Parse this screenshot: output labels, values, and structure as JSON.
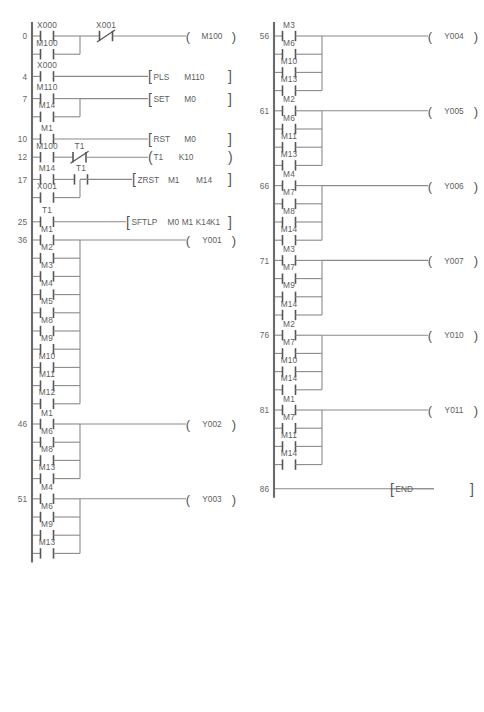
{
  "document": {
    "type": "plc-ladder-logic-diagram",
    "title": "",
    "background_color": "#ffffff",
    "line_color": "#6a6a6a",
    "text_color": "#5d5d5d"
  },
  "columns": [
    {
      "id": "left-column",
      "rungs": [
        {
          "step": "0",
          "branches": [
            [
              {
                "type": "no",
                "label": "X000"
              }
            ],
            [
              {
                "type": "no",
                "label": "M100"
              }
            ]
          ],
          "series_after_branch": [
            {
              "type": "nc",
              "label": "X001"
            }
          ],
          "output": {
            "type": "coil",
            "label": "M100"
          }
        },
        {
          "step": "4",
          "branches": [
            [
              {
                "type": "no",
                "label": "X000"
              }
            ]
          ],
          "output": {
            "type": "instruction",
            "name": "PLS",
            "operands": [
              "M110"
            ],
            "bracket": "square"
          }
        },
        {
          "step": "7",
          "branches": [
            [
              {
                "type": "no",
                "label": "M110"
              }
            ],
            [
              {
                "type": "no",
                "label": "M14"
              }
            ]
          ],
          "output": {
            "type": "instruction",
            "name": "SET",
            "operands": [
              "M0"
            ],
            "bracket": "square"
          }
        },
        {
          "step": "10",
          "branches": [
            [
              {
                "type": "no",
                "label": "M1"
              }
            ]
          ],
          "output": {
            "type": "instruction",
            "name": "RST",
            "operands": [
              "M0"
            ],
            "bracket": "square"
          }
        },
        {
          "step": "12",
          "branches": [
            [
              {
                "type": "no",
                "label": "M100"
              }
            ]
          ],
          "series_after_branch": [
            {
              "type": "nc",
              "label": "T1"
            }
          ],
          "output": {
            "type": "timer",
            "name": "T1",
            "operands": [
              "K10"
            ],
            "bracket": "round"
          }
        },
        {
          "step": "17",
          "branches": [
            [
              {
                "type": "no",
                "label": "M14"
              },
              {
                "type": "no",
                "label": "T1"
              }
            ],
            [
              {
                "type": "no",
                "label": "X001"
              }
            ]
          ],
          "output": {
            "type": "instruction",
            "name": "ZRST",
            "operands": [
              "M1",
              "M14"
            ],
            "bracket": "square"
          }
        },
        {
          "step": "25",
          "branches": [
            [
              {
                "type": "no",
                "label": "T1"
              }
            ]
          ],
          "output": {
            "type": "instruction",
            "name": "SFTLP",
            "operands": [
              "M0",
              "M1",
              "K14",
              "K1"
            ],
            "bracket": "square"
          }
        },
        {
          "step": "36",
          "branches": [
            [
              {
                "type": "no",
                "label": "M1"
              }
            ],
            [
              {
                "type": "no",
                "label": "M2"
              }
            ],
            [
              {
                "type": "no",
                "label": "M3"
              }
            ],
            [
              {
                "type": "no",
                "label": "M4"
              }
            ],
            [
              {
                "type": "no",
                "label": "M5"
              }
            ],
            [
              {
                "type": "no",
                "label": "M8"
              }
            ],
            [
              {
                "type": "no",
                "label": "M9"
              }
            ],
            [
              {
                "type": "no",
                "label": "M10"
              }
            ],
            [
              {
                "type": "no",
                "label": "M11"
              }
            ],
            [
              {
                "type": "no",
                "label": "M12"
              }
            ]
          ],
          "output": {
            "type": "coil",
            "label": "Y001"
          }
        },
        {
          "step": "46",
          "branches": [
            [
              {
                "type": "no",
                "label": "M1"
              }
            ],
            [
              {
                "type": "no",
                "label": "M6"
              }
            ],
            [
              {
                "type": "no",
                "label": "M8"
              }
            ],
            [
              {
                "type": "no",
                "label": "M13"
              }
            ]
          ],
          "output": {
            "type": "coil",
            "label": "Y002"
          }
        },
        {
          "step": "51",
          "branches": [
            [
              {
                "type": "no",
                "label": "M4"
              }
            ],
            [
              {
                "type": "no",
                "label": "M6"
              }
            ],
            [
              {
                "type": "no",
                "label": "M9"
              }
            ],
            [
              {
                "type": "no",
                "label": "M13"
              }
            ]
          ],
          "output": {
            "type": "coil",
            "label": "Y003"
          }
        }
      ]
    },
    {
      "id": "right-column",
      "rungs": [
        {
          "step": "56",
          "branches": [
            [
              {
                "type": "no",
                "label": "M3"
              }
            ],
            [
              {
                "type": "no",
                "label": "M6"
              }
            ],
            [
              {
                "type": "no",
                "label": "M10"
              }
            ],
            [
              {
                "type": "no",
                "label": "M13"
              }
            ]
          ],
          "output": {
            "type": "coil",
            "label": "Y004"
          }
        },
        {
          "step": "61",
          "branches": [
            [
              {
                "type": "no",
                "label": "M2"
              }
            ],
            [
              {
                "type": "no",
                "label": "M6"
              }
            ],
            [
              {
                "type": "no",
                "label": "M11"
              }
            ],
            [
              {
                "type": "no",
                "label": "M13"
              }
            ]
          ],
          "output": {
            "type": "coil",
            "label": "Y005"
          }
        },
        {
          "step": "66",
          "branches": [
            [
              {
                "type": "no",
                "label": "M4"
              }
            ],
            [
              {
                "type": "no",
                "label": "M7"
              }
            ],
            [
              {
                "type": "no",
                "label": "M8"
              }
            ],
            [
              {
                "type": "no",
                "label": "M14"
              }
            ]
          ],
          "output": {
            "type": "coil",
            "label": "Y006"
          }
        },
        {
          "step": "71",
          "branches": [
            [
              {
                "type": "no",
                "label": "M3"
              }
            ],
            [
              {
                "type": "no",
                "label": "M7"
              }
            ],
            [
              {
                "type": "no",
                "label": "M9"
              }
            ],
            [
              {
                "type": "no",
                "label": "M14"
              }
            ]
          ],
          "output": {
            "type": "coil",
            "label": "Y007"
          }
        },
        {
          "step": "76",
          "branches": [
            [
              {
                "type": "no",
                "label": "M2"
              }
            ],
            [
              {
                "type": "no",
                "label": "M7"
              }
            ],
            [
              {
                "type": "no",
                "label": "M10"
              }
            ],
            [
              {
                "type": "no",
                "label": "M14"
              }
            ]
          ],
          "output": {
            "type": "coil",
            "label": "Y010"
          }
        },
        {
          "step": "81",
          "branches": [
            [
              {
                "type": "no",
                "label": "M1"
              }
            ],
            [
              {
                "type": "no",
                "label": "M7"
              }
            ],
            [
              {
                "type": "no",
                "label": "M11"
              }
            ],
            [
              {
                "type": "no",
                "label": "M14"
              }
            ]
          ],
          "output": {
            "type": "coil",
            "label": "Y011"
          }
        },
        {
          "step": "86",
          "branches": [],
          "output": {
            "type": "instruction",
            "name": "END",
            "operands": [],
            "bracket": "square"
          }
        }
      ]
    }
  ],
  "labels": {
    "left_steps": [
      "0",
      "4",
      "7",
      "10",
      "12",
      "17",
      "25",
      "36",
      "46",
      "51"
    ],
    "right_steps": [
      "56",
      "61",
      "66",
      "71",
      "76",
      "81",
      "86"
    ],
    "coils_left": [
      "M100",
      "Y001",
      "Y002",
      "Y003"
    ],
    "coils_right": [
      "Y004",
      "Y005",
      "Y006",
      "Y007",
      "Y010",
      "Y011"
    ],
    "instructions": [
      "PLS",
      "SET",
      "RST",
      "ZRST",
      "SFTLP",
      "END"
    ],
    "timer": "T1",
    "constants": [
      "K10",
      "K14",
      "K1"
    ],
    "inputs": [
      "X000",
      "X001"
    ],
    "internal_relays": [
      "M0",
      "M1",
      "M2",
      "M3",
      "M4",
      "M5",
      "M6",
      "M7",
      "M8",
      "M9",
      "M10",
      "M11",
      "M12",
      "M13",
      "M14",
      "M100",
      "M110"
    ]
  }
}
